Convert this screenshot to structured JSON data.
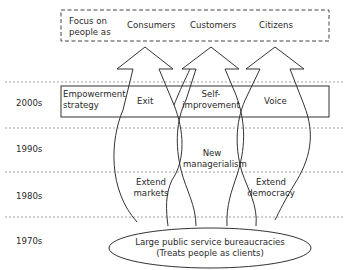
{
  "focus_box": {
    "label": [
      "Focus on",
      "people as"
    ],
    "consumers": "Consumers",
    "customers": "Customers",
    "citizens": "Citizens"
  },
  "decades": [
    "2000s",
    "1990s",
    "1980s",
    "1970s"
  ],
  "empowerment": {
    "label": [
      "Empowerment",
      "strategy"
    ],
    "exit": "Exit",
    "self_improvement": [
      "Self-",
      "improvement"
    ],
    "voice": "Voice"
  },
  "mid": {
    "new_managerialism": [
      "New",
      "managerialism"
    ],
    "extend_markets": [
      "Extend",
      "markets"
    ],
    "extend_democracy": [
      "Extend",
      "democracy"
    ]
  },
  "base": {
    "line1": "Large public service bureaucracies",
    "line2": "(Treats people as clients)"
  },
  "colors": {
    "stroke": "#333333",
    "dotted": "#888888",
    "text": "#2a2a2a"
  }
}
